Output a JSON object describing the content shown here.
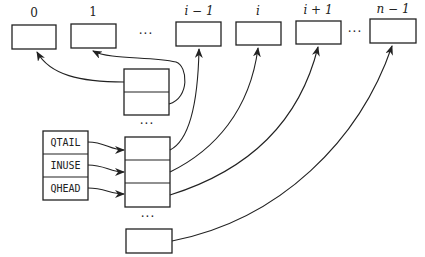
{
  "diagram": {
    "type": "queue-pointer-array",
    "top_slots": [
      {
        "label": "0"
      },
      {
        "label": "1"
      },
      {
        "label": "i − 1"
      },
      {
        "label": "i"
      },
      {
        "label": "i + 1"
      },
      {
        "label": "n − 1"
      }
    ],
    "top_ellipses": [
      "···",
      "···"
    ],
    "registers": [
      {
        "label": "QTAIL"
      },
      {
        "label": "INUSE"
      },
      {
        "label": "QHEAD"
      }
    ],
    "stack_ellipses": [
      "···",
      "···"
    ],
    "colors": {
      "stroke": "#222222",
      "background": "#ffffff"
    }
  }
}
